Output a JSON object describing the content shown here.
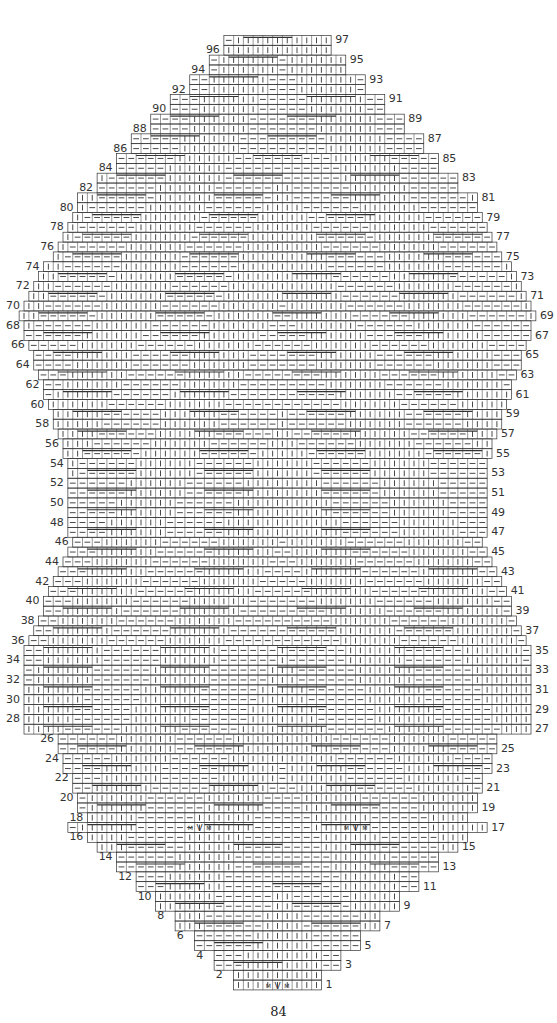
{
  "diagram": {
    "type": "knitting-chart",
    "title": "",
    "rows_total": 97,
    "row_labels_left": [
      2,
      4,
      6,
      8,
      10,
      12,
      14,
      16,
      18,
      20,
      22,
      24,
      26,
      28,
      30,
      32,
      34,
      36,
      38,
      40,
      42,
      44,
      46,
      48,
      50,
      52,
      54,
      56,
      58,
      60,
      62,
      64,
      66,
      68,
      70,
      72,
      74,
      76,
      78,
      80,
      82,
      84,
      86,
      88,
      90,
      92,
      94,
      96
    ],
    "row_labels_right": [
      1,
      3,
      5,
      7,
      9,
      11,
      13,
      15,
      17,
      19,
      21,
      23,
      25,
      27,
      29,
      31,
      33,
      35,
      37,
      39,
      41,
      43,
      45,
      47,
      49,
      51,
      53,
      55,
      57,
      59,
      61,
      63,
      65,
      67,
      69,
      71,
      73,
      75,
      77,
      79,
      81,
      83,
      85,
      87,
      89,
      91,
      93,
      95,
      97
    ],
    "symbols": {
      "knit": "|",
      "purl": "—",
      "make_one": "M",
      "decrease": "V",
      "bobble": "?",
      "cable_line": "cable"
    },
    "increase_markers": [
      "M",
      "M"
    ],
    "line_color": "#333333",
    "background": "#ffffff"
  },
  "page": {
    "number": "84"
  }
}
